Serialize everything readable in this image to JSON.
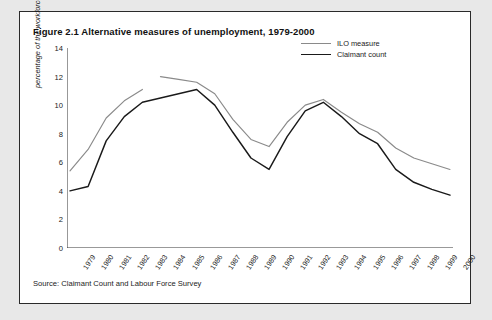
{
  "figure": {
    "title": "Figure 2.1 Alternative measures of unemployment, 1979-2000",
    "source": "Source: Claimant Count and Labour Force Survey"
  },
  "colors": {
    "ilo": "#8a8a8a",
    "claimant": "#1a1a1a",
    "axis": "#333333",
    "frame": "#2a2a2a",
    "page_background": "#e8e8e8",
    "figure_background": "#ffffff"
  },
  "chart_data": {
    "type": "line",
    "title": "Figure 2.1 Alternative measures of unemployment, 1979-2000",
    "xlabel": "",
    "ylabel": "percentage of the workforce unemployed",
    "grid": false,
    "legend_position": "top-right",
    "ylim": [
      0,
      14
    ],
    "yticks": [
      0,
      2,
      4,
      6,
      8,
      10,
      12,
      14
    ],
    "categories": [
      "1979",
      "1980",
      "1981",
      "1982",
      "1983",
      "1984",
      "1985",
      "1986",
      "1987",
      "1988",
      "1989",
      "1990",
      "1991",
      "1992",
      "1993",
      "1994",
      "1995",
      "1996",
      "1997",
      "1998",
      "1999",
      "2000"
    ],
    "series": [
      {
        "name": "ILO measure",
        "color": "#8a8a8a",
        "values": [
          5.4,
          6.9,
          9.1,
          10.3,
          11.1,
          12.0,
          11.8,
          11.6,
          10.8,
          9.0,
          7.6,
          7.1,
          8.8,
          10.0,
          10.4,
          9.5,
          8.7,
          8.1,
          7.0,
          6.3,
          5.9,
          5.5
        ],
        "break_after": "1983"
      },
      {
        "name": "Claimant count",
        "color": "#1a1a1a",
        "values": [
          4.0,
          4.3,
          7.5,
          9.2,
          10.2,
          10.5,
          10.8,
          11.1,
          10.0,
          8.1,
          6.3,
          5.5,
          7.8,
          9.6,
          10.2,
          9.2,
          8.0,
          7.3,
          5.5,
          4.6,
          4.1,
          3.7
        ],
        "break_after": null
      }
    ]
  },
  "legend": [
    {
      "label": "ILO measure"
    },
    {
      "label": "Claimant count"
    }
  ]
}
